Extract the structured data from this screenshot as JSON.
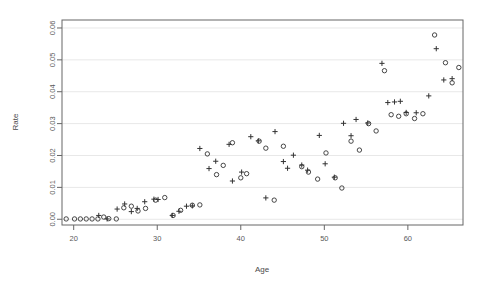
{
  "chart_data": {
    "type": "scatter",
    "title": "",
    "xlabel": "Age",
    "ylabel": "Rate",
    "xlim": [
      18.6,
      66.6
    ],
    "ylim": [
      -0.0018,
      0.0625
    ],
    "xticks": [
      20,
      30,
      40,
      50,
      60
    ],
    "xtick_labels": [
      "20",
      "30",
      "40",
      "50",
      "60"
    ],
    "yticks": [
      0.0,
      0.01,
      0.02,
      0.03,
      0.04,
      0.05,
      0.06
    ],
    "ytick_labels": [
      "0.00",
      "0.01",
      "0.02",
      "0.03",
      "0.04",
      "0.05",
      "0.06"
    ],
    "grid": "horizontal",
    "grid_color": "#e8e8e8",
    "axis_color": "#666666",
    "marker_color": "#333333",
    "legend": [],
    "series": [
      {
        "name": "plus",
        "marker": "plus",
        "points": [
          [
            23.0,
            0.0012
          ],
          [
            24.0,
            0.0001
          ],
          [
            25.2,
            0.0032
          ],
          [
            26.1,
            0.0048
          ],
          [
            26.9,
            0.0024
          ],
          [
            27.6,
            0.0034
          ],
          [
            28.5,
            0.0055
          ],
          [
            29.6,
            0.0063
          ],
          [
            30.1,
            0.0062
          ],
          [
            31.8,
            0.0012
          ],
          [
            32.6,
            0.0025
          ],
          [
            33.5,
            0.0041
          ],
          [
            34.2,
            0.0042
          ],
          [
            35.1,
            0.0222
          ],
          [
            36.2,
            0.0159
          ],
          [
            37.0,
            0.0182
          ],
          [
            38.6,
            0.0235
          ],
          [
            39.0,
            0.012
          ],
          [
            40.1,
            0.0148
          ],
          [
            41.2,
            0.0259
          ],
          [
            42.1,
            0.0246
          ],
          [
            43.0,
            0.0067
          ],
          [
            44.1,
            0.0275
          ],
          [
            45.1,
            0.0181
          ],
          [
            45.6,
            0.016
          ],
          [
            46.3,
            0.0201
          ],
          [
            47.3,
            0.017
          ],
          [
            48.0,
            0.0154
          ],
          [
            49.4,
            0.0263
          ],
          [
            50.1,
            0.0174
          ],
          [
            51.2,
            0.0132
          ],
          [
            52.3,
            0.0301
          ],
          [
            53.2,
            0.0262
          ],
          [
            53.8,
            0.0313
          ],
          [
            55.2,
            0.0302
          ],
          [
            56.9,
            0.0489
          ],
          [
            57.6,
            0.0366
          ],
          [
            58.4,
            0.0368
          ],
          [
            59.1,
            0.037
          ],
          [
            59.8,
            0.0335
          ],
          [
            61.0,
            0.0334
          ],
          [
            62.5,
            0.0387
          ],
          [
            63.4,
            0.0535
          ],
          [
            64.3,
            0.0437
          ],
          [
            65.3,
            0.0441
          ]
        ]
      },
      {
        "name": "circle",
        "marker": "circle",
        "points": [
          [
            19.1,
            0.0001
          ],
          [
            20.1,
            0.0001
          ],
          [
            20.8,
            0.0001
          ],
          [
            21.5,
            0.0001
          ],
          [
            22.2,
            0.0001
          ],
          [
            22.9,
            0.0001
          ],
          [
            23.6,
            0.0007
          ],
          [
            24.2,
            0.0002
          ],
          [
            25.1,
            0.0001
          ],
          [
            26.0,
            0.0036
          ],
          [
            26.9,
            0.0041
          ],
          [
            27.7,
            0.0026
          ],
          [
            28.6,
            0.0034
          ],
          [
            29.8,
            0.006
          ],
          [
            30.9,
            0.0068
          ],
          [
            31.9,
            0.0012
          ],
          [
            32.8,
            0.0028
          ],
          [
            34.2,
            0.0044
          ],
          [
            35.1,
            0.0045
          ],
          [
            36.0,
            0.0205
          ],
          [
            37.1,
            0.014
          ],
          [
            37.9,
            0.0169
          ],
          [
            39.0,
            0.024
          ],
          [
            40.0,
            0.013
          ],
          [
            40.7,
            0.0143
          ],
          [
            42.2,
            0.0245
          ],
          [
            43.0,
            0.0223
          ],
          [
            44.0,
            0.006
          ],
          [
            45.1,
            0.0229
          ],
          [
            47.3,
            0.0165
          ],
          [
            48.1,
            0.0148
          ],
          [
            49.2,
            0.0126
          ],
          [
            50.2,
            0.0208
          ],
          [
            51.3,
            0.013
          ],
          [
            52.1,
            0.0098
          ],
          [
            53.2,
            0.0245
          ],
          [
            54.2,
            0.0217
          ],
          [
            55.3,
            0.03
          ],
          [
            56.2,
            0.0277
          ],
          [
            57.2,
            0.0466
          ],
          [
            58.0,
            0.0328
          ],
          [
            58.9,
            0.0323
          ],
          [
            59.8,
            0.0331
          ],
          [
            60.8,
            0.0316
          ],
          [
            61.8,
            0.0331
          ],
          [
            63.2,
            0.0578
          ],
          [
            64.5,
            0.0491
          ],
          [
            65.3,
            0.0428
          ],
          [
            66.1,
            0.0476
          ]
        ]
      }
    ]
  },
  "geometry": {
    "plot_left": 62,
    "plot_right": 463,
    "plot_top": 20,
    "plot_bottom": 225
  }
}
